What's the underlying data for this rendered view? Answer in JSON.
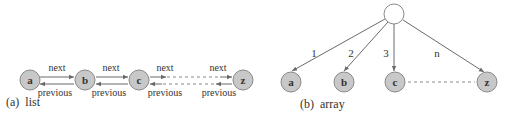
{
  "list_diagram": {
    "caption": "(a)  list",
    "nodes": [
      {
        "id": "a",
        "label": "a"
      },
      {
        "id": "b",
        "label": "b"
      },
      {
        "id": "c",
        "label": "c"
      },
      {
        "id": "z",
        "label": "z"
      }
    ],
    "next_label": "next",
    "previous_label": "previous",
    "links": [
      {
        "from": "a",
        "to": "b",
        "next": "next",
        "previous": "previous",
        "style": "solid"
      },
      {
        "from": "b",
        "to": "c",
        "next": "next",
        "previous": "previous",
        "style": "solid"
      },
      {
        "from": "c",
        "to": "z",
        "next_left": "next",
        "next_right": "next",
        "previous_left": "previous",
        "previous_right": "previous",
        "style": "dashed"
      }
    ]
  },
  "array_diagram": {
    "caption": "(b)  array",
    "root": {
      "label": ""
    },
    "nodes": [
      {
        "id": "a",
        "label": "a",
        "index": "1"
      },
      {
        "id": "b",
        "label": "b",
        "index": "2"
      },
      {
        "id": "c",
        "label": "c",
        "index": "3"
      },
      {
        "id": "z",
        "label": "z",
        "index": "n"
      }
    ]
  }
}
